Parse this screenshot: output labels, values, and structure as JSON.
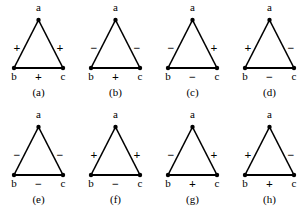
{
  "figure": {
    "type": "signed-triangle-diagram",
    "vertex_labels": {
      "top": "a",
      "bottom_left": "b",
      "bottom_right": "c"
    },
    "edge_names": {
      "ab": "a-b",
      "ac": "a-c",
      "bc": "b-c"
    },
    "colors": {
      "ink": "#000000",
      "background": "#ffffff"
    },
    "rows": [
      {
        "panels": [
          {
            "caption": "(a)",
            "vertex_a": "a",
            "vertex_b": "b",
            "vertex_c": "c",
            "sign_ab": "+",
            "sign_ac": "+",
            "sign_bc": "+"
          },
          {
            "caption": "(b)",
            "vertex_a": "a",
            "vertex_b": "b",
            "vertex_c": "c",
            "sign_ab": "−",
            "sign_ac": "−",
            "sign_bc": "+"
          },
          {
            "caption": "(c)",
            "vertex_a": "a",
            "vertex_b": "b",
            "vertex_c": "c",
            "sign_ab": "−",
            "sign_ac": "+",
            "sign_bc": "−"
          },
          {
            "caption": "(d)",
            "vertex_a": "a",
            "vertex_b": "b",
            "vertex_c": "c",
            "sign_ab": "+",
            "sign_ac": "−",
            "sign_bc": "−"
          }
        ]
      },
      {
        "panels": [
          {
            "caption": "(e)",
            "vertex_a": "a",
            "vertex_b": "b",
            "vertex_c": "c",
            "sign_ab": "−",
            "sign_ac": "−",
            "sign_bc": "−"
          },
          {
            "caption": "(f)",
            "vertex_a": "a",
            "vertex_b": "b",
            "vertex_c": "c",
            "sign_ab": "+",
            "sign_ac": "+",
            "sign_bc": "−"
          },
          {
            "caption": "(g)",
            "vertex_a": "a",
            "vertex_b": "b",
            "vertex_c": "c",
            "sign_ab": "−",
            "sign_ac": "+",
            "sign_bc": "+"
          },
          {
            "caption": "(h)",
            "vertex_a": "a",
            "vertex_b": "b",
            "vertex_c": "c",
            "sign_ab": "+",
            "sign_ac": "−",
            "sign_bc": "+"
          }
        ]
      }
    ]
  }
}
